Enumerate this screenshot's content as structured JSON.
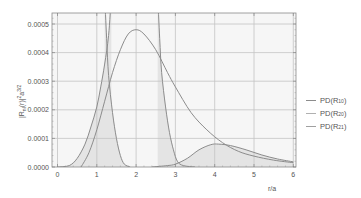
{
  "chart_data": {
    "type": "line",
    "title": "",
    "xlabel": "r/a",
    "ylabel": "|R_nl(r)|²a^(3/2)",
    "xlim": [
      -0.15,
      6.05
    ],
    "ylim": [
      0,
      0.00053
    ],
    "grid": true,
    "legend_position": "right",
    "x_ticks": [
      "0",
      "1",
      "2",
      "3",
      "4",
      "5",
      "6"
    ],
    "y_ticks": [
      "0.0000",
      "0.0001",
      "0.0002",
      "0.0003",
      "0.0004",
      "0.0005"
    ],
    "series": [
      {
        "name": "PD(R10)",
        "color": "#8c8c8c",
        "filled": true,
        "points": [
          [
            0.0,
            0
          ],
          [
            0.3,
            5e-06
          ],
          [
            0.5,
            3e-05
          ],
          [
            0.7,
            8e-05
          ],
          [
            0.85,
            0.00014
          ],
          [
            1.0,
            0.00021
          ],
          [
            1.1,
            0.00028
          ],
          [
            1.2,
            0.00036
          ],
          [
            1.3,
            0.00046
          ],
          [
            1.37,
            0.0006
          ]
        ]
      },
      {
        "name": "PD(R20)",
        "color": "#8c8c8c",
        "filled": false,
        "points": [
          [
            0.6,
            0.0
          ],
          [
            0.8,
            5e-05
          ],
          [
            1.0,
            0.00013
          ],
          [
            1.2,
            0.00023
          ],
          [
            1.4,
            0.00033
          ],
          [
            1.6,
            0.00041
          ],
          [
            1.8,
            0.000465
          ],
          [
            2.0,
            0.00048
          ],
          [
            2.2,
            0.000465
          ],
          [
            2.5,
            0.00041
          ],
          [
            2.8,
            0.00033
          ],
          [
            3.0,
            0.00028
          ],
          [
            3.4,
            0.00019
          ],
          [
            3.8,
            0.00013
          ],
          [
            4.2,
            8.5e-05
          ],
          [
            4.6,
            5.5e-05
          ],
          [
            5.0,
            3.8e-05
          ],
          [
            5.5,
            2.4e-05
          ],
          [
            6.0,
            1.5e-05
          ]
        ]
      },
      {
        "name": "PD(R21)",
        "color": "#8c8c8c",
        "filled": true,
        "points": [
          [
            2.4,
            0
          ],
          [
            2.8,
            5e-06
          ],
          [
            3.0,
            1e-05
          ],
          [
            3.3,
            3e-05
          ],
          [
            3.6,
            6e-05
          ],
          [
            3.9,
            7.8e-05
          ],
          [
            4.1,
            8e-05
          ],
          [
            4.4,
            7.5e-05
          ],
          [
            4.8,
            6e-05
          ],
          [
            5.2,
            4.2e-05
          ],
          [
            5.6,
            2.8e-05
          ],
          [
            6.0,
            1.8e-05
          ]
        ]
      },
      {
        "name": "narrow-peak-descending",
        "color": "#8c8c8c",
        "filled": true,
        "points": [
          [
            1.2,
            0.0006
          ],
          [
            1.25,
            0.00045
          ],
          [
            1.3,
            0.00032
          ],
          [
            1.4,
            0.00019
          ],
          [
            1.5,
            0.0001
          ],
          [
            1.6,
            4e-05
          ],
          [
            1.7,
            1e-05
          ],
          [
            1.85,
            0
          ]
        ]
      },
      {
        "name": "steep-descending-2",
        "color": "#8c8c8c",
        "filled": true,
        "points": [
          [
            2.55,
            0.0006
          ],
          [
            2.6,
            0.00045
          ],
          [
            2.65,
            0.00033
          ],
          [
            2.75,
            0.00021
          ],
          [
            2.85,
            0.00012
          ],
          [
            2.95,
            6e-05
          ],
          [
            3.05,
            2e-05
          ],
          [
            3.2,
            5e-06
          ],
          [
            3.5,
            0
          ]
        ]
      }
    ],
    "legend": [
      "PD(R10)",
      "PD(R20)",
      "PD(R21)"
    ]
  },
  "legend": {
    "items": [
      {
        "label": "PD(R",
        "sub": "10",
        "close": ")"
      },
      {
        "label": "PD(R",
        "sub": "20",
        "close": ")"
      },
      {
        "label": "PD(R",
        "sub": "21",
        "close": ")"
      }
    ]
  },
  "axes": {
    "xlabel": "r/a",
    "ylabel_main": "|R",
    "ylabel_sub": "nl",
    "ylabel_rest": "(r)|",
    "ylabel_sup1": "2",
    "ylabel_a": "a",
    "ylabel_sup2": "3/2"
  }
}
